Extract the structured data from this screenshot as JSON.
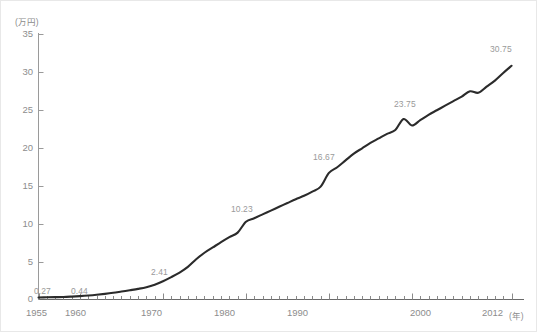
{
  "chart_data": {
    "type": "line",
    "title": "",
    "xlabel": "年",
    "ylabel": "万円",
    "unit_label_y": "(万円)",
    "unit_label_x": "(年)",
    "xlim": [
      1955,
      2012
    ],
    "ylim": [
      0,
      35
    ],
    "grid": false,
    "legend": "none",
    "y_ticks": [
      0,
      5,
      10,
      15,
      20,
      25,
      30,
      35
    ],
    "y_tick_labels": [
      "0",
      "5",
      "10",
      "15",
      "20",
      "25",
      "30",
      "35"
    ],
    "x_ticks": [
      1955,
      1960,
      1970,
      1980,
      1990,
      2000,
      2012
    ],
    "x_tick_labels": [
      "1955",
      "1960",
      "1970",
      "1980",
      "1990",
      "2000",
      "2012"
    ],
    "x_minor_tick_interval": 1,
    "series": [
      {
        "name": "平均値",
        "color": "#2b2b2b",
        "x": [
          1955,
          1956,
          1957,
          1958,
          1959,
          1960,
          1961,
          1962,
          1963,
          1964,
          1965,
          1966,
          1967,
          1968,
          1969,
          1970,
          1971,
          1972,
          1973,
          1974,
          1975,
          1976,
          1977,
          1978,
          1979,
          1980,
          1981,
          1982,
          1983,
          1984,
          1985,
          1986,
          1987,
          1988,
          1989,
          1990,
          1991,
          1992,
          1993,
          1994,
          1995,
          1996,
          1997,
          1998,
          1999,
          2000,
          2001,
          2002,
          2003,
          2004,
          2005,
          2006,
          2007,
          2008,
          2009,
          2010,
          2011,
          2012
        ],
        "values": [
          0.27,
          0.29,
          0.31,
          0.33,
          0.38,
          0.44,
          0.52,
          0.62,
          0.74,
          0.88,
          1.05,
          1.22,
          1.4,
          1.62,
          1.95,
          2.41,
          2.95,
          3.55,
          4.3,
          5.3,
          6.15,
          6.85,
          7.55,
          8.2,
          8.8,
          10.23,
          10.7,
          11.2,
          11.7,
          12.2,
          12.7,
          13.2,
          13.65,
          14.2,
          14.85,
          16.67,
          17.4,
          18.3,
          19.2,
          19.9,
          20.6,
          21.2,
          21.8,
          22.3,
          23.75,
          22.9,
          23.6,
          24.3,
          24.9,
          25.5,
          26.1,
          26.7,
          27.4,
          27.2,
          28.0,
          28.8,
          29.8,
          30.75
        ]
      }
    ],
    "annotations": [
      {
        "text": "0.27",
        "x": 1955,
        "value": 0.27
      },
      {
        "text": "0.44",
        "x": 1960,
        "value": 0.44
      },
      {
        "text": "2.41",
        "x": 1970,
        "value": 2.41
      },
      {
        "text": "10.23",
        "x": 1980,
        "value": 10.23
      },
      {
        "text": "16.67",
        "x": 1990,
        "value": 16.67
      },
      {
        "text": "23.75",
        "x": 1999,
        "value": 23.75
      },
      {
        "text": "30.75",
        "x": 2012,
        "value": 30.75
      }
    ],
    "axis_color": "#9a9a9a",
    "line_color": "#2b2b2b",
    "background": "#ffffff"
  },
  "labels": {
    "y_unit": "(万円)",
    "y_0": "0",
    "y_5": "5",
    "y_10": "10",
    "y_15": "15",
    "y_20": "20",
    "y_25": "25",
    "y_30": "30",
    "y_35": "35",
    "x_1955": "1955",
    "x_1960": "1960",
    "x_1970": "1970",
    "x_1980": "1980",
    "x_1990": "1990",
    "x_2000": "2000",
    "x_2012": "2012",
    "x_unit": "(年)",
    "p_0_27": "0.27",
    "p_0_44": "0.44",
    "p_2_41": "2.41",
    "p_10_23": "10.23",
    "p_16_67": "16.67",
    "p_23_75": "23.75",
    "p_30_75": "30.75"
  }
}
